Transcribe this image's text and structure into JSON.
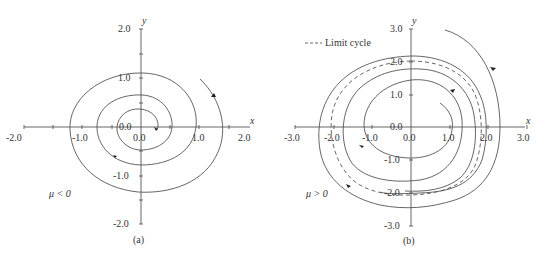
{
  "panels": [
    {
      "id": "a",
      "caption": "(a)",
      "condition": "μ < 0",
      "x_axis": {
        "label": "x",
        "ticks": [
          "-2.0",
          "-1.0",
          "0.0",
          "1.0",
          "2.0"
        ]
      },
      "y_axis": {
        "label": "y",
        "ticks": [
          "2.0",
          "1.0",
          "0.0",
          "-1.0",
          "-2.0"
        ]
      },
      "description": "Stable spiral: trajectory spirals inward to origin"
    },
    {
      "id": "b",
      "caption": "(b)",
      "condition": "μ > 0",
      "legend": {
        "label": "Limit cycle",
        "style": "dashed"
      },
      "x_axis": {
        "label": "x",
        "ticks": [
          "-3.0",
          "-2.0",
          "-1.0",
          "0.0",
          "1.0",
          "2.0",
          "3.0"
        ]
      },
      "y_axis": {
        "label": "y",
        "ticks": [
          "3.0",
          "2.0",
          "1.0",
          "0.0",
          "-1.0",
          "-2.0",
          "-3.0"
        ]
      },
      "description": "Trajectories from inside and outside converge to a limit cycle of radius ~2"
    }
  ],
  "colors": {
    "line": "#444444",
    "text": "#333333",
    "background": "#ffffff"
  }
}
